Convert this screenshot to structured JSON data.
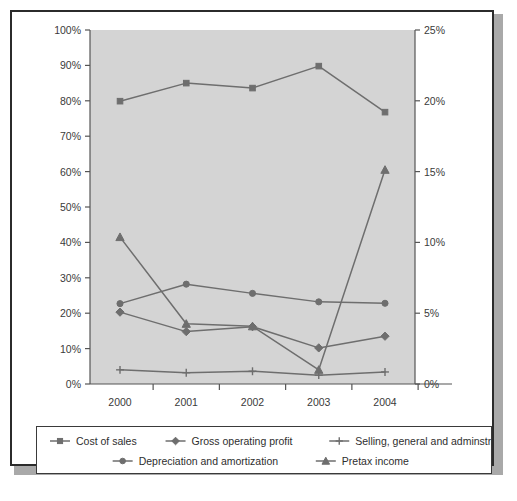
{
  "chart_data": {
    "type": "line",
    "title": "",
    "subtitle": "",
    "xlabel": "",
    "ylabel": "",
    "categories": [
      "2000",
      "2001",
      "2002",
      "2003",
      "2004"
    ],
    "grid": false,
    "legend_position": "bottom",
    "plot_background_color": "#d4d4d4",
    "line_color": "#6e6e6e",
    "axis_color": "#555555",
    "frame_color": "#2b2b2b",
    "left_axis": {
      "label": "",
      "ticks": [
        "0%",
        "10%",
        "20%",
        "30%",
        "40%",
        "50%",
        "60%",
        "70%",
        "80%",
        "90%",
        "100%"
      ],
      "tick_values": [
        0,
        10,
        20,
        30,
        40,
        50,
        60,
        70,
        80,
        90,
        100
      ],
      "ylim": [
        0,
        100
      ]
    },
    "right_axis": {
      "label": "",
      "ticks": [
        "0%",
        "5%",
        "10%",
        "15%",
        "20%",
        "25%"
      ],
      "tick_values": [
        0,
        5,
        10,
        15,
        20,
        25
      ],
      "ylim": [
        0,
        25
      ]
    },
    "series": [
      {
        "name": "Cost of sales",
        "marker": "square",
        "axis": "left",
        "values": [
          79.9,
          85.0,
          83.6,
          89.8,
          76.8
        ]
      },
      {
        "name": "Gross operating profit",
        "marker": "diamond",
        "axis": "left",
        "values": [
          20.3,
          14.8,
          16.2,
          10.2,
          13.5
        ]
      },
      {
        "name": "Selling, general and adminstrative expense",
        "marker": "plus",
        "axis": "left",
        "values": [
          4.0,
          3.2,
          3.6,
          2.5,
          3.4
        ]
      },
      {
        "name": "Depreciation and amortization",
        "marker": "circle",
        "axis": "left",
        "values": [
          22.7,
          28.2,
          25.6,
          23.2,
          22.8
        ]
      },
      {
        "name": "Pretax income",
        "marker": "triangle",
        "axis": "left",
        "values": [
          41.5,
          17.0,
          16.3,
          4.0,
          60.5
        ]
      }
    ]
  },
  "legend": {
    "row1": [
      "Cost of sales",
      "Gross operating profit",
      "Selling, general and adminstrative expense"
    ],
    "row2": [
      "Depreciation and amortization",
      "Pretax income"
    ]
  }
}
